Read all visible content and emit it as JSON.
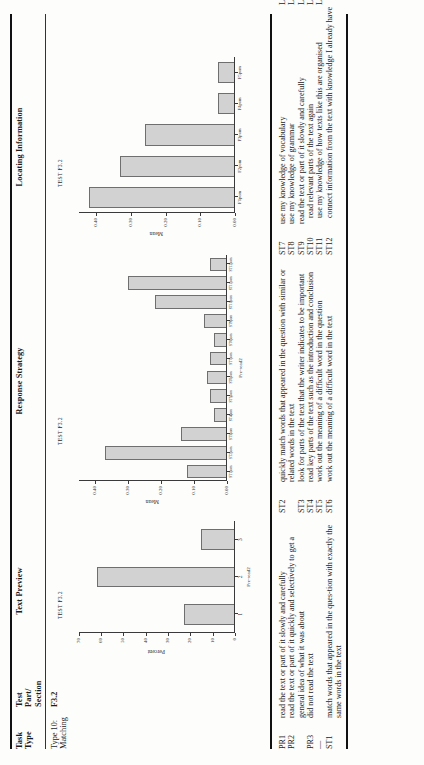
{
  "table": {
    "headers": {
      "task_type": [
        "Task",
        "Type"
      ],
      "test_part_section": [
        "Test",
        "Part/",
        "Section"
      ],
      "text_preview": "Text Preview",
      "response_strategy": "Response Strategy",
      "locating_information": "Locating Information"
    },
    "row": {
      "task_type": [
        "Type 10:",
        "Matching"
      ],
      "test_part_section": "F3.2"
    }
  },
  "chart_data": [
    {
      "type": "bar",
      "title": "TEST F3.2",
      "panel": "Text Preview",
      "categories": [
        "1",
        "2",
        "3"
      ],
      "values": [
        23,
        62,
        15
      ],
      "xlabel": "Pre-read2",
      "ylabel": "Percent",
      "ylim": [
        0,
        70
      ],
      "yticks": [
        0,
        10,
        20,
        30,
        40,
        50,
        60,
        70
      ],
      "ytick_labels": [
        "0",
        "10",
        "20",
        "30",
        "40",
        "50",
        "60",
        "70"
      ],
      "grid": false,
      "legend": "none"
    },
    {
      "type": "bar",
      "title": "TEST F3.2",
      "panel": "Response Strategy",
      "categories": [
        "ST1pom",
        "ST2pom",
        "ST3pom",
        "ST4pom",
        "ST5pom",
        "ST6pom",
        "ST7pom",
        "ST8pom",
        "ST9pom",
        "ST10pom",
        "ST11pom",
        "ST12pom"
      ],
      "values": [
        0.12,
        0.37,
        0.14,
        0.04,
        0.05,
        0.06,
        0.05,
        0.04,
        0.07,
        0.22,
        0.3,
        0.05
      ],
      "xlabel": "Pre-read2",
      "ylabel": "Mean",
      "ylim": [
        0.0,
        0.45
      ],
      "yticks": [
        0.0,
        0.1,
        0.2,
        0.3,
        0.4
      ],
      "ytick_labels": [
        "0.00",
        "0.10",
        "0.20",
        "0.30",
        "0.40"
      ],
      "grid": false,
      "legend": "none"
    },
    {
      "type": "bar",
      "title": "TEST F3.2",
      "panel": "Locating Information",
      "categories": [
        "F1pom",
        "F2pom",
        "F3pom",
        "F4pom",
        "F5pom"
      ],
      "values": [
        0.42,
        0.33,
        0.26,
        0.05,
        0.05
      ],
      "xlabel": "",
      "ylabel": "Mean",
      "ylim": [
        0.0,
        0.45
      ],
      "yticks": [
        0.0,
        0.1,
        0.2,
        0.3,
        0.4
      ],
      "ytick_labels": [
        "0.00",
        "0.10",
        "0.20",
        "0.30",
        "0.40"
      ],
      "grid": false,
      "legend": "none"
    }
  ],
  "legend": {
    "column1": [
      {
        "key": "PR1",
        "text": "read the text or part of it slowly and carefully"
      },
      {
        "key": "PR2",
        "text": "read the text or part of it quickly and selectively to get a general idea of what it was about"
      },
      {
        "key": "PR3",
        "text": "did not read the text"
      },
      {
        "key": "—",
        "text": ""
      },
      {
        "key": "ST1",
        "text": "match words that appeared in the ques-tion with exactly the same words in the text"
      }
    ],
    "column2": [
      {
        "key": "ST2",
        "text": "quickly match words that appeared in the question with similar or related words in the text"
      },
      {
        "key": "ST3",
        "text": "look for parts of the text that the writer indicates to be important"
      },
      {
        "key": "ST4",
        "text": "read key parts of the text such as the introduction and conclusion"
      },
      {
        "key": "ST5",
        "text": "work out the meaning of a difficult word in the question"
      },
      {
        "key": "ST6",
        "text": "work out the meaning of a difficult word in the text"
      }
    ],
    "column3": [
      {
        "key": "ST7",
        "text": "use my knowledge of vocabulary"
      },
      {
        "key": "ST8",
        "text": "use my knowledge of grammar"
      },
      {
        "key": "ST9",
        "text": "read the text or part of it slowly and carefully"
      },
      {
        "key": "ST10",
        "text": "read relevant parts of the text again"
      },
      {
        "key": "ST11",
        "text": "use my knowledge of how texts like this are organised"
      },
      {
        "key": "ST12",
        "text": "connect information from the text with knowledge I already have"
      }
    ],
    "column4": [
      {
        "key": "L1",
        "text": "within a single sentence"
      },
      {
        "key": "L2",
        "text": "by putting information together across sentences"
      },
      {
        "key": "L3",
        "text": "by understanding how information in the whole text fits together"
      },
      {
        "key": "L4",
        "text": "without reading the text"
      },
      {
        "key": "L5",
        "text": "could not answer the question"
      }
    ]
  },
  "colors": {
    "bar_fill": "#d2d2d2",
    "bar_stroke": "#6f6f6f",
    "rule": "#111111",
    "text": "#1b1b1b"
  }
}
